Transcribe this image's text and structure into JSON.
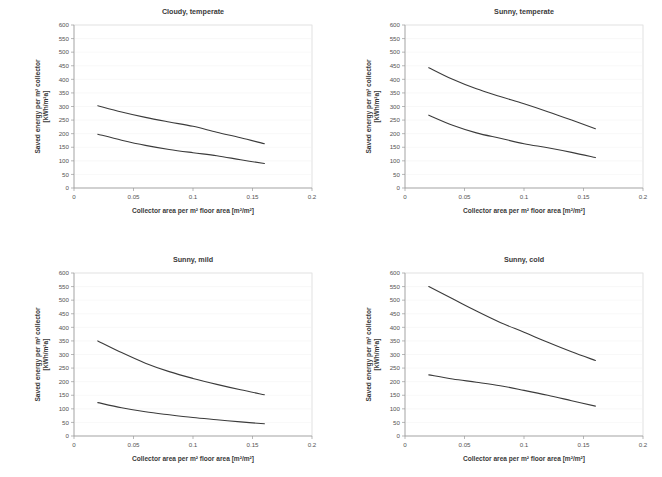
{
  "figure": {
    "background": "#ffffff",
    "line_color": "#3b3b3b",
    "frame_color": "#d4d4d4",
    "axis_color": "#9a9a9a"
  },
  "common": {
    "xlabel": "Collector area per m² floor area [m²/m²]",
    "ylabel_line1": "Saved energy per m² collector",
    "ylabel_line2": "[kWh/m²a]",
    "xticks": [
      "0",
      "0.05",
      "0.1",
      "0.15",
      "0.2"
    ],
    "xtick_values": [
      0,
      0.05,
      0.1,
      0.15,
      0.2
    ],
    "yticks": [
      "0",
      "50",
      "100",
      "150",
      "200",
      "250",
      "300",
      "350",
      "400",
      "450",
      "500",
      "550",
      "600"
    ],
    "ytick_values": [
      0,
      50,
      100,
      150,
      200,
      250,
      300,
      350,
      400,
      450,
      500,
      550,
      600
    ],
    "xlim": [
      0,
      0.2
    ],
    "ylim": [
      0,
      600
    ]
  },
  "chart_data": [
    {
      "type": "line",
      "title": "Cloudy, temperate",
      "xlabel": "Collector area per m² floor area [m²/m²]",
      "ylabel": "Saved energy per m² collector [kWh/m²a]",
      "xlim": [
        0,
        0.2
      ],
      "ylim": [
        0,
        600
      ],
      "grid": false,
      "legend": "none",
      "x": [
        0.02,
        0.04,
        0.06,
        0.08,
        0.1,
        0.12,
        0.14,
        0.16
      ],
      "series": [
        {
          "name": "upper curve",
          "values": [
            303,
            280,
            260,
            243,
            227,
            205,
            185,
            163
          ]
        },
        {
          "name": "lower curve",
          "values": [
            198,
            176,
            157,
            142,
            130,
            119,
            104,
            90
          ]
        }
      ]
    },
    {
      "type": "line",
      "title": "Sunny, temperate",
      "xlabel": "Collector area per m² floor area [m²/m²]",
      "ylabel": "Saved energy per m² collector [kWh/m²a]",
      "xlim": [
        0,
        0.2
      ],
      "ylim": [
        0,
        600
      ],
      "grid": false,
      "legend": "none",
      "x": [
        0.02,
        0.04,
        0.06,
        0.08,
        0.1,
        0.12,
        0.14,
        0.16
      ],
      "series": [
        {
          "name": "upper curve",
          "values": [
            443,
            400,
            365,
            337,
            310,
            281,
            250,
            218
          ]
        },
        {
          "name": "lower curve",
          "values": [
            268,
            231,
            203,
            183,
            163,
            148,
            131,
            112
          ]
        }
      ]
    },
    {
      "type": "line",
      "title": "Sunny, mild",
      "xlabel": "Collector area per m² floor area [m²/m²]",
      "ylabel": "Saved energy per m² collector [kWh/m²a]",
      "xlim": [
        0,
        0.2
      ],
      "ylim": [
        0,
        600
      ],
      "grid": false,
      "legend": "none",
      "x": [
        0.02,
        0.04,
        0.06,
        0.08,
        0.1,
        0.12,
        0.14,
        0.16
      ],
      "series": [
        {
          "name": "upper curve",
          "values": [
            350,
            307,
            268,
            237,
            212,
            190,
            170,
            152
          ]
        },
        {
          "name": "lower curve",
          "values": [
            123,
            104,
            89,
            78,
            68,
            60,
            52,
            45
          ]
        }
      ]
    },
    {
      "type": "line",
      "title": "Sunny, cold",
      "xlabel": "Collector area per m² floor area [m²/m²]",
      "ylabel": "Saved energy per m² collector [kWh/m²a]",
      "xlim": [
        0,
        0.2
      ],
      "ylim": [
        0,
        600
      ],
      "grid": false,
      "legend": "none",
      "x": [
        0.02,
        0.04,
        0.06,
        0.08,
        0.1,
        0.12,
        0.14,
        0.16
      ],
      "series": [
        {
          "name": "upper curve",
          "values": [
            550,
            505,
            460,
            418,
            382,
            345,
            310,
            278
          ]
        },
        {
          "name": "lower curve",
          "values": [
            225,
            210,
            198,
            185,
            168,
            150,
            130,
            110
          ]
        }
      ]
    }
  ]
}
